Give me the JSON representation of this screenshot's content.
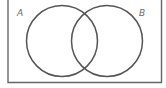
{
  "diagram": {
    "type": "venn",
    "sets": [
      {
        "id": "A",
        "label": "A"
      },
      {
        "id": "B",
        "label": "B"
      }
    ],
    "colors": {
      "stroke": "#555555",
      "frame": "#666666",
      "label": "#6b6b6b",
      "background": "#ffffff"
    }
  }
}
